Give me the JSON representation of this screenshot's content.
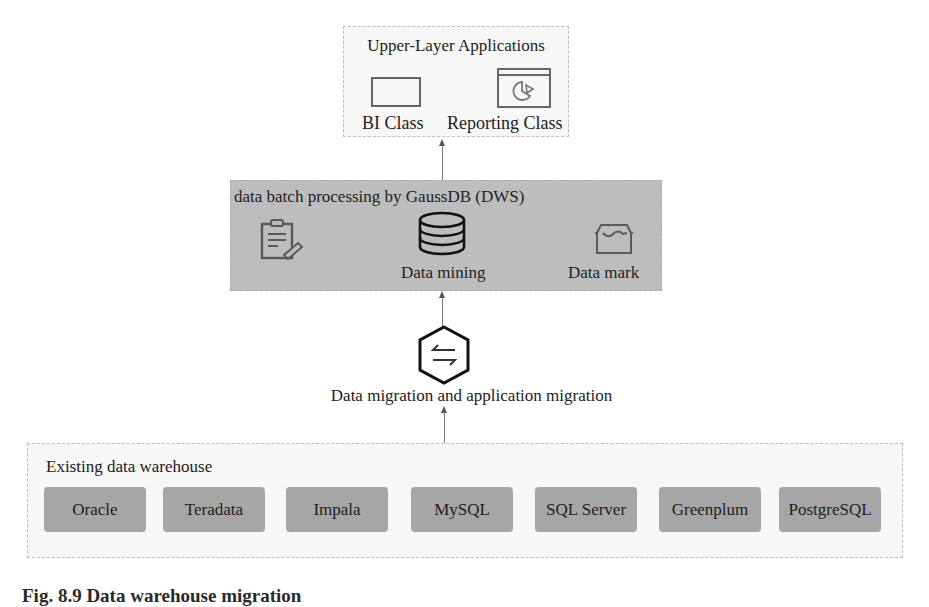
{
  "upper": {
    "title": "Upper-Layer Applications",
    "items": [
      {
        "label": "BI Class",
        "icon": "window-icon"
      },
      {
        "label": "Reporting Class",
        "icon": "pie-chart-report-icon"
      }
    ]
  },
  "processing": {
    "title": "data batch processing by GaussDB (DWS)",
    "items": [
      {
        "label": "",
        "icon": "clipboard-edit-icon"
      },
      {
        "label": "Data mining",
        "icon": "database-icon"
      },
      {
        "label": "Data mark",
        "icon": "data-mart-icon"
      }
    ]
  },
  "migration": {
    "label": "Data migration and application migration",
    "icon": "exchange-arrows-icon"
  },
  "warehouse": {
    "title": "Existing data warehouse",
    "sources": [
      "Oracle",
      "Teradata",
      "Impala",
      "MySQL",
      "SQL Server",
      "Greenplum",
      "PostgreSQL"
    ]
  },
  "caption": "Fig. 8.9 Data warehouse migration"
}
